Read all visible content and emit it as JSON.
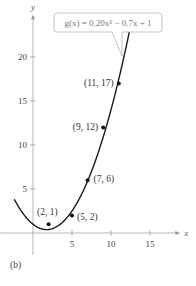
{
  "chart_data": {
    "type": "line",
    "title": "",
    "panel_label": "(b)",
    "function_label": "g(x) = 0.20x² − 0.7x + 1",
    "function": {
      "a": 0.2,
      "b": -0.7,
      "c": 1,
      "x_start": -2.4,
      "x_end": 12.4
    },
    "xlabel": "x",
    "ylabel": "y",
    "xlim": [
      -4.2,
      18.5
    ],
    "ylim": [
      -2.5,
      24.5
    ],
    "x_ticks": [
      5,
      10,
      15
    ],
    "y_ticks": [
      5,
      10,
      15,
      20
    ],
    "grid": false,
    "series": [
      {
        "name": "data points",
        "type": "scatter",
        "points": [
          {
            "x": 2,
            "y": 1,
            "label": "(2, 1)"
          },
          {
            "x": 5,
            "y": 2,
            "label": "(5, 2)"
          },
          {
            "x": 7,
            "y": 6,
            "label": "(7, 6)"
          },
          {
            "x": 9,
            "y": 12,
            "label": "(9, 12)"
          },
          {
            "x": 11,
            "y": 17,
            "label": "(11, 17)"
          }
        ]
      },
      {
        "name": "g(x) = 0.20x² − 0.7x + 1",
        "type": "line"
      }
    ]
  },
  "colors": {
    "axis": "#9a9a9a",
    "curve": "#1a1a1a",
    "point": "#111111",
    "callout_border": "#b8b8b8"
  }
}
